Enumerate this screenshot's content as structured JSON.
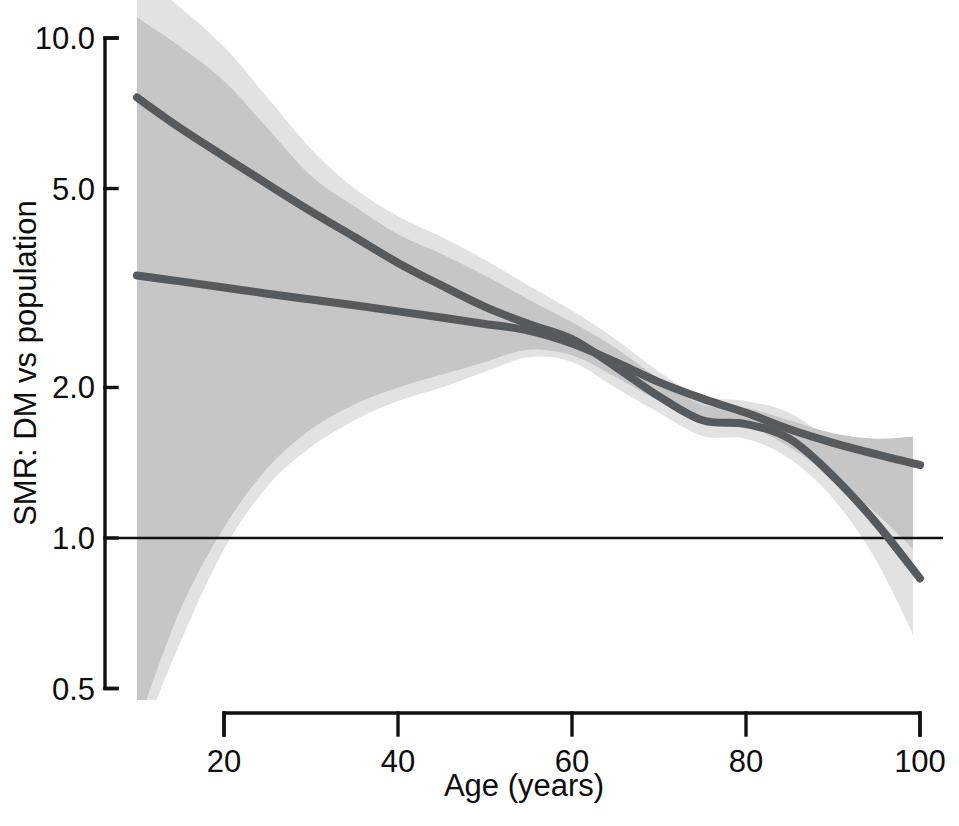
{
  "figure": {
    "title": "",
    "background_color": "#ffffff"
  },
  "axes": {
    "y": {
      "label": "SMR: DM vs population",
      "scale": "log",
      "ticks": [
        "10.0",
        "5.0",
        "2.0",
        "1.0",
        "0.5"
      ],
      "tick_values": [
        10.0,
        5.0,
        2.0,
        1.0,
        0.5
      ],
      "limits": [
        0.45,
        11.0
      ]
    },
    "x": {
      "label": "Age (years)",
      "scale": "linear",
      "ticks": [
        "20",
        "40",
        "60",
        "80",
        "100"
      ],
      "tick_values": [
        20,
        40,
        60,
        80,
        100
      ],
      "limits": [
        20,
        100
      ]
    }
  },
  "reference_line": {
    "name": "unity-line",
    "value": 1.0,
    "color": "#111111"
  },
  "colors": {
    "curve": "#555a5e",
    "band_spline": "#e2e2e2",
    "band_linear": "#c6c6c6",
    "axis": "#111111"
  },
  "chart_data": {
    "type": "line",
    "title": "",
    "xlabel": "Age (years)",
    "ylabel": "SMR: DM vs population",
    "xlim": [
      20,
      100
    ],
    "ylim": [
      0.45,
      11.0
    ],
    "yscale": "log",
    "grid": false,
    "legend": "none",
    "x": [
      10,
      15,
      20,
      25,
      30,
      35,
      40,
      45,
      50,
      55,
      60,
      65,
      70,
      75,
      80,
      85,
      90,
      95,
      100
    ],
    "series": [
      {
        "name": "Spline model (SMR)",
        "style": "smooth-curve",
        "color": "#555a5e",
        "values": [
          7.6,
          6.6,
          5.8,
          5.1,
          4.5,
          4.0,
          3.55,
          3.2,
          2.9,
          2.68,
          2.5,
          2.2,
          1.92,
          1.72,
          1.69,
          1.58,
          1.33,
          1.07,
          0.83
        ],
        "ci_band": {
          "name": "spline-confidence-band",
          "color": "#e2e2e2",
          "lower": [
            0.38,
            0.62,
            0.95,
            1.27,
            1.52,
            1.72,
            1.88,
            2.0,
            2.15,
            2.3,
            2.25,
            2.0,
            1.78,
            1.6,
            1.58,
            1.44,
            1.2,
            0.9,
            0.6
          ],
          "upper": [
            13.5,
            11.5,
            9.6,
            7.6,
            6.0,
            5.0,
            4.4,
            4.0,
            3.6,
            3.2,
            2.85,
            2.5,
            2.15,
            1.92,
            1.88,
            1.78,
            1.55,
            1.35,
            1.2
          ]
        }
      },
      {
        "name": "Linear (log-linear) model (SMR)",
        "style": "straight-line",
        "color": "#555a5e",
        "values": [
          3.35,
          3.26,
          3.17,
          3.08,
          3.0,
          2.92,
          2.84,
          2.76,
          2.68,
          2.6,
          2.45,
          2.25,
          2.05,
          1.9,
          1.78,
          1.65,
          1.55,
          1.47,
          1.4
        ],
        "ci_band": {
          "name": "linear-confidence-band",
          "color": "#c6c6c6",
          "lower": [
            0.42,
            0.72,
            1.05,
            1.38,
            1.65,
            1.85,
            2.0,
            2.12,
            2.25,
            2.38,
            2.32,
            2.1,
            1.88,
            1.72,
            1.68,
            1.52,
            1.32,
            1.12,
            0.92
          ],
          "upper": [
            11.0,
            9.6,
            8.2,
            6.6,
            5.3,
            4.6,
            4.05,
            3.7,
            3.35,
            3.0,
            2.7,
            2.4,
            2.08,
            1.85,
            1.82,
            1.72,
            1.62,
            1.58,
            1.6
          ]
        }
      }
    ],
    "annotations": [
      {
        "name": "unity-reference",
        "type": "hline",
        "y": 1.0,
        "label": ""
      }
    ]
  }
}
